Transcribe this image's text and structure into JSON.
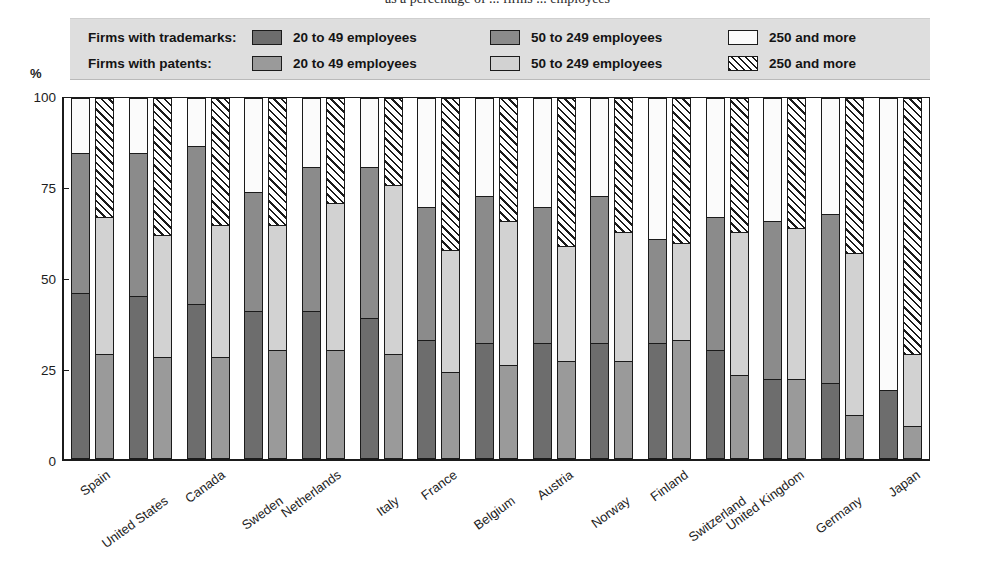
{
  "title": "as a percentage of ... firms ... employees",
  "legend": {
    "rows": [
      {
        "label": "Firms with trademarks:",
        "items": [
          {
            "text": "20 to 49 employees",
            "icon": "swatch-dark-gray"
          },
          {
            "text": "50 to 249 employees",
            "icon": "swatch-mid-gray"
          },
          {
            "text": "250 and more",
            "icon": "swatch-white"
          }
        ]
      },
      {
        "label": "Firms with patents:",
        "items": [
          {
            "text": "20 to 49 employees",
            "icon": "swatch-gray"
          },
          {
            "text": "50 to 249 employees",
            "icon": "swatch-light-gray"
          },
          {
            "text": "250 and more",
            "icon": "swatch-hatched"
          }
        ]
      }
    ]
  },
  "axis": {
    "y_unit": "%",
    "y_ticks": [
      "100",
      "75",
      "50",
      "25",
      "0"
    ]
  },
  "colors": {
    "tm_small": "#6d6d6d",
    "tm_med": "#8b8b8b",
    "tm_large": "#fbfbfb",
    "pt_small": "#9a9a9a",
    "pt_med": "#d2d2d2",
    "pt_large": "#ffffff",
    "axis": "#1b1b1b",
    "legend_bg": "#dedede"
  },
  "chart_data": {
    "type": "bar",
    "subtype": "stacked-percent-paired",
    "title": "as a percentage of ... firms ... employees",
    "xlabel": "",
    "ylabel": "%",
    "ylim": [
      0,
      100
    ],
    "yticks": [
      0,
      25,
      50,
      75,
      100
    ],
    "grid": false,
    "legend_position": "top",
    "categories": [
      "Spain",
      "United States",
      "Canada",
      "Sweden",
      "Netherlands",
      "Italy",
      "France",
      "Belgium",
      "Austria",
      "Norway",
      "Finland",
      "Switzerland",
      "United Kingdom",
      "Germany",
      "Japan"
    ],
    "series": [
      {
        "group": "Firms with trademarks",
        "name": "20 to 49 employees",
        "values": [
          46,
          45,
          43,
          41,
          41,
          39,
          33,
          32,
          32,
          32,
          32,
          30,
          22,
          21,
          19
        ]
      },
      {
        "group": "Firms with trademarks",
        "name": "50 to 249 employees",
        "values": [
          39,
          40,
          44,
          33,
          40,
          42,
          37,
          41,
          38,
          41,
          29,
          37,
          44,
          47,
          0
        ]
      },
      {
        "group": "Firms with trademarks",
        "name": "250 and more",
        "values": [
          15,
          15,
          13,
          26,
          19,
          19,
          30,
          27,
          30,
          27,
          39,
          33,
          34,
          32,
          81
        ]
      },
      {
        "group": "Firms with patents",
        "name": "20 to 49 employees",
        "values": [
          29,
          28,
          28,
          30,
          30,
          29,
          24,
          26,
          27,
          27,
          33,
          23,
          22,
          12,
          9
        ]
      },
      {
        "group": "Firms with patents",
        "name": "50 to 249 employees",
        "values": [
          38,
          34,
          37,
          35,
          41,
          47,
          34,
          40,
          32,
          36,
          27,
          40,
          42,
          45,
          20
        ]
      },
      {
        "group": "Firms with patents",
        "name": "250 and more",
        "values": [
          33,
          38,
          35,
          35,
          29,
          24,
          42,
          34,
          41,
          37,
          40,
          37,
          36,
          43,
          71
        ]
      }
    ],
    "cumulative_tops": {
      "trademarks": [
        {
          "country": "Spain",
          "small": 46,
          "small_plus_med": 85
        },
        {
          "country": "United States",
          "small": 45,
          "small_plus_med": 85
        },
        {
          "country": "Canada",
          "small": 43,
          "small_plus_med": 87
        },
        {
          "country": "Sweden",
          "small": 41,
          "small_plus_med": 74
        },
        {
          "country": "Netherlands",
          "small": 41,
          "small_plus_med": 81
        },
        {
          "country": "Italy",
          "small": 39,
          "small_plus_med": 81
        },
        {
          "country": "France",
          "small": 33,
          "small_plus_med": 70
        },
        {
          "country": "Belgium",
          "small": 32,
          "small_plus_med": 73
        },
        {
          "country": "Austria",
          "small": 32,
          "small_plus_med": 70
        },
        {
          "country": "Norway",
          "small": 32,
          "small_plus_med": 73
        },
        {
          "country": "Finland",
          "small": 32,
          "small_plus_med": 61
        },
        {
          "country": "Switzerland",
          "small": 30,
          "small_plus_med": 67
        },
        {
          "country": "United Kingdom",
          "small": 22,
          "small_plus_med": 66
        },
        {
          "country": "Germany",
          "small": 21,
          "small_plus_med": 68
        },
        {
          "country": "Japan",
          "small": 19,
          "small_plus_med": 19
        }
      ],
      "patents": [
        {
          "country": "Spain",
          "small": 29,
          "small_plus_med": 67
        },
        {
          "country": "United States",
          "small": 28,
          "small_plus_med": 62
        },
        {
          "country": "Canada",
          "small": 28,
          "small_plus_med": 65
        },
        {
          "country": "Sweden",
          "small": 30,
          "small_plus_med": 65
        },
        {
          "country": "Netherlands",
          "small": 30,
          "small_plus_med": 71
        },
        {
          "country": "Italy",
          "small": 29,
          "small_plus_med": 76
        },
        {
          "country": "France",
          "small": 24,
          "small_plus_med": 58
        },
        {
          "country": "Belgium",
          "small": 26,
          "small_plus_med": 66
        },
        {
          "country": "Austria",
          "small": 27,
          "small_plus_med": 59
        },
        {
          "country": "Norway",
          "small": 27,
          "small_plus_med": 63
        },
        {
          "country": "Finland",
          "small": 33,
          "small_plus_med": 60
        },
        {
          "country": "Switzerland",
          "small": 23,
          "small_plus_med": 63
        },
        {
          "country": "United Kingdom",
          "small": 22,
          "small_plus_med": 64
        },
        {
          "country": "Germany",
          "small": 12,
          "small_plus_med": 57
        },
        {
          "country": "Japan",
          "small": 9,
          "small_plus_med": 29
        }
      ]
    }
  }
}
